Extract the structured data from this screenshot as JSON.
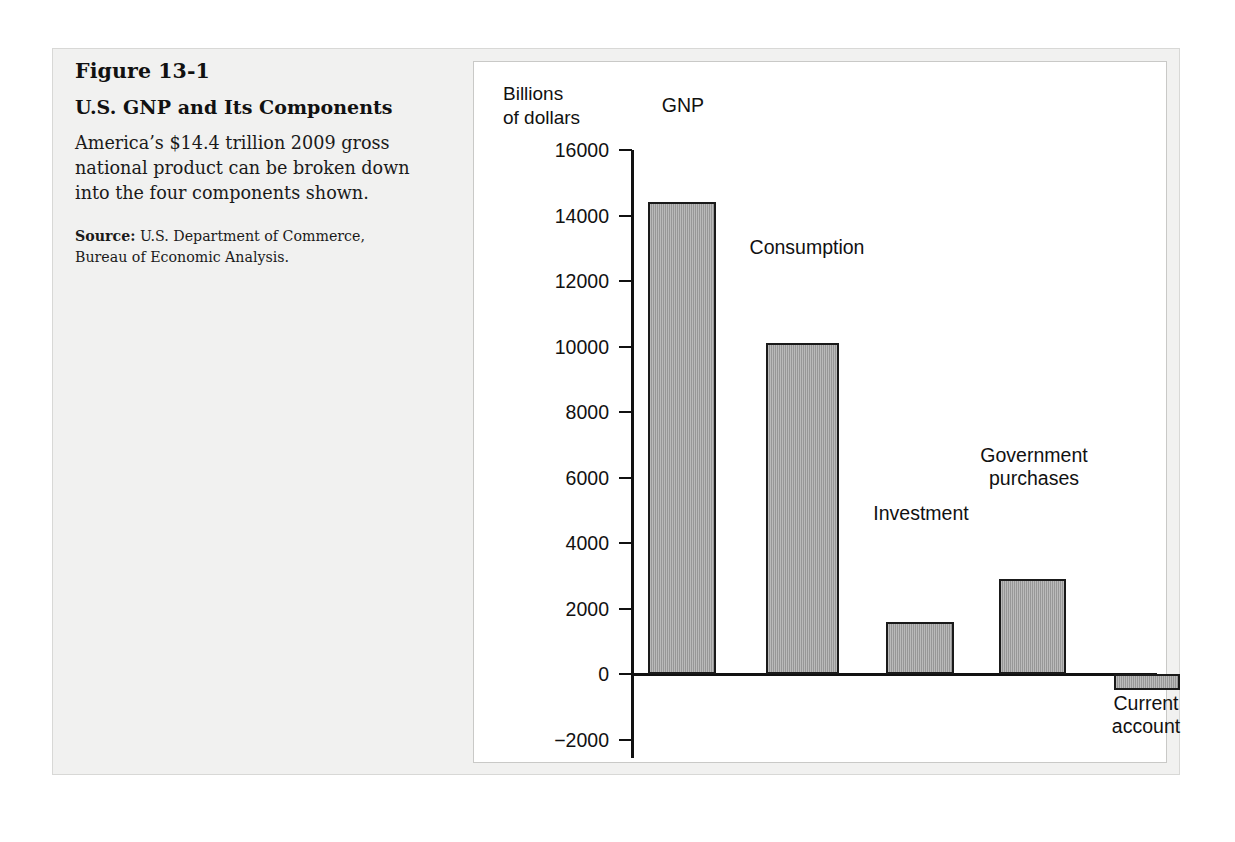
{
  "figure": {
    "number": "Figure 13-1",
    "title": "U.S. GNP and Its Components",
    "description": "America’s $14.4 trillion 2009 gross national product can be broken down into the four components shown.",
    "source_label": "Source:",
    "source_text": " U.S. Department of Commerce, Bureau of Economic Analysis."
  },
  "chart_data": {
    "type": "bar",
    "title": "U.S. GNP and Its Components",
    "subtitle": "",
    "xlabel": "",
    "ylabel": "Billions\nof dollars",
    "categories": [
      "GNP",
      "Consumption",
      "Investment",
      "Government purchases",
      "Current account"
    ],
    "values": [
      14400,
      10100,
      1600,
      2900,
      -500
    ],
    "value_labels": [
      "GNP",
      "Consumption",
      "Investment",
      "Government\npurchases",
      "Current\naccount"
    ],
    "ylim": [
      -2600,
      16400
    ],
    "yticks": [
      16000,
      14000,
      12000,
      10000,
      8000,
      6000,
      4000,
      2000,
      0,
      -2000
    ],
    "ytick_labels": [
      "16000",
      "14000",
      "12000",
      "10000",
      "8000",
      "6000",
      "4000",
      "2000",
      "0",
      "−2000"
    ],
    "grid": false,
    "legend": "none",
    "bar_color": "#9d9d9d",
    "bar_edge_color": "#1a1a1a",
    "axis_color": "#111111"
  }
}
